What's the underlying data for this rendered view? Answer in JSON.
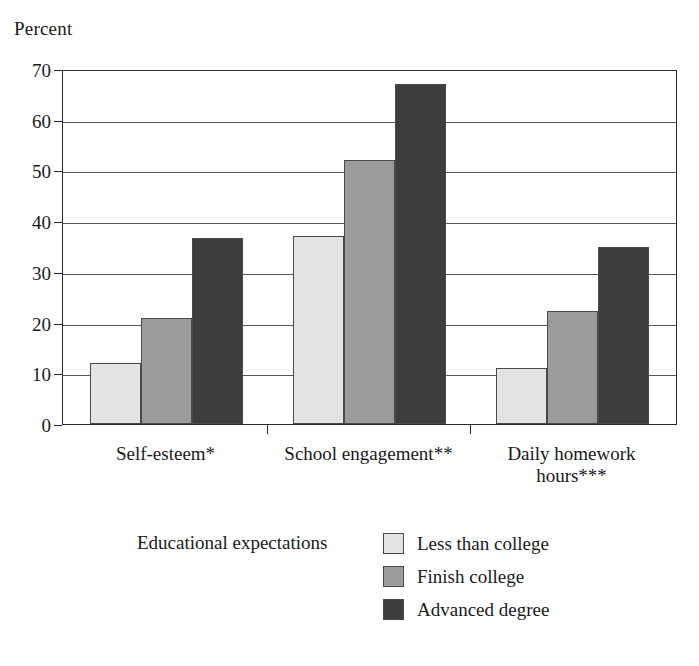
{
  "chart_data": {
    "type": "bar",
    "title": "",
    "ylabel": "Percent",
    "xlabel": "",
    "ylim": [
      0,
      70
    ],
    "yticks": [
      0,
      10,
      20,
      30,
      40,
      50,
      60,
      70
    ],
    "grid": true,
    "legend_position": "bottom",
    "legend_title": "Educational expectations",
    "categories": [
      "Self-esteem*",
      "School engagement**",
      "Daily homework\nhours***"
    ],
    "series": [
      {
        "name": "Less than college",
        "color": "#e3e3e3",
        "values": [
          12,
          37,
          11
        ]
      },
      {
        "name": "Finish college",
        "color": "#9b9b9b",
        "values": [
          21,
          52,
          22.2
        ]
      },
      {
        "name": "Advanced degree",
        "color": "#3d3d3d",
        "values": [
          36.6,
          67,
          35
        ]
      }
    ]
  },
  "axis": {
    "y_tick_labels": [
      "0",
      "10",
      "20",
      "30",
      "40",
      "50",
      "60",
      "70"
    ]
  },
  "colors": {
    "axis": "#2b2b2b",
    "gridline": "#55585b",
    "bar_outline": "#4a4a4a",
    "background": "#ffffff",
    "text": "#1a1a1a"
  }
}
